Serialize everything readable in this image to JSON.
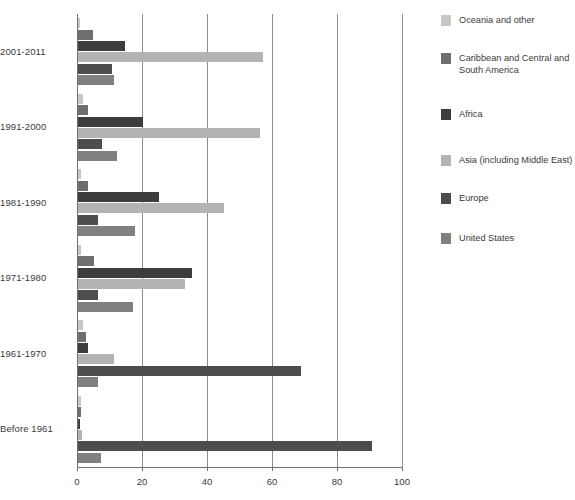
{
  "chart_data": {
    "type": "bar",
    "orientation": "horizontal",
    "title": "",
    "subtitle": "",
    "xlabel": "",
    "ylabel": "",
    "xlim": [
      0,
      100
    ],
    "xticks": [
      0,
      20,
      40,
      60,
      80,
      100
    ],
    "xtick_labels": [
      "0",
      "20",
      "40",
      "60",
      "80",
      "100"
    ],
    "grid": true,
    "grid_axis": "x",
    "legend_position": "right",
    "categories": [
      "2001-2011",
      "1991-2000",
      "1981-1990",
      "1971-1980",
      "1961-1970",
      "Before 1961"
    ],
    "series": [
      {
        "name": "Oceania and other",
        "color": "#c7c7c7",
        "values": [
          0.6,
          1.6,
          1.0,
          1.0,
          1.6,
          0.8
        ]
      },
      {
        "name": "Caribbean and Central and South America",
        "color": "#6e6e6e",
        "values": [
          4.5,
          3.0,
          3.0,
          5.0,
          2.6,
          0.8
        ]
      },
      {
        "name": "Africa",
        "color": "#3d3d3d",
        "values": [
          14.5,
          20.0,
          25.0,
          35.0,
          3.2,
          0.5
        ]
      },
      {
        "name": "Asia (including Middle East)",
        "color": "#b3b3b3",
        "values": [
          57.0,
          56.0,
          45.0,
          33.0,
          11.0,
          1.2
        ]
      },
      {
        "name": "Europe",
        "color": "#4d4d4d",
        "values": [
          10.5,
          7.5,
          6.0,
          6.0,
          68.5,
          90.5
        ]
      },
      {
        "name": "United States",
        "color": "#808080",
        "values": [
          11.0,
          12.0,
          17.5,
          17.0,
          6.0,
          7.0
        ]
      }
    ]
  },
  "legend": {
    "items": [
      {
        "label": "Oceania and other",
        "color": "#c7c7c7"
      },
      {
        "label": "Caribbean and Central and South America",
        "color": "#6e6e6e"
      },
      {
        "label": "Africa",
        "color": "#3d3d3d"
      },
      {
        "label": "Asia (including Middle East)",
        "color": "#b3b3b3"
      },
      {
        "label": "Europe",
        "color": "#4d4d4d"
      },
      {
        "label": "United States",
        "color": "#808080"
      }
    ]
  }
}
